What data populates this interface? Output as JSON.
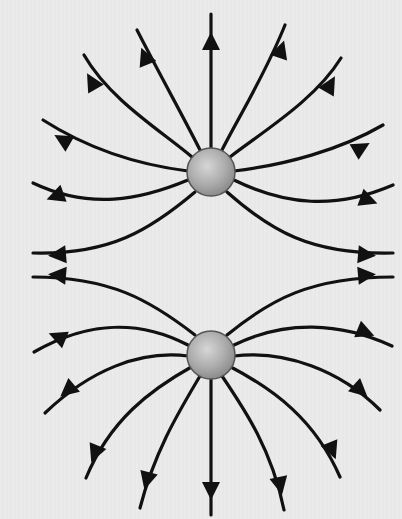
{
  "diagram": {
    "title": "Electric field lines of two like (positive) charges",
    "colors": {
      "background": "#e9e9e9",
      "field_line": "#111111",
      "charge_fill_light": "#cfcfcf",
      "charge_fill_dark": "#8a8a8a",
      "charge_stroke": "#555555"
    },
    "charges": [
      {
        "name": "top-charge",
        "cx": 211,
        "cy": 172,
        "r": 24
      },
      {
        "name": "bottom-charge",
        "cx": 211,
        "cy": 355,
        "r": 24
      }
    ],
    "field_lines": {
      "top": [
        {
          "name": "top-up",
          "d": "M211 148 L211 14",
          "arrow": {
            "x": 211,
            "y": 42,
            "angle": -90
          }
        },
        {
          "name": "top-up-left-1",
          "d": "M200 150 C185 120 160 75 137 30",
          "arrow": {
            "x": 145,
            "y": 57,
            "angle": -112
          }
        },
        {
          "name": "top-up-right-1",
          "d": "M222 150 C237 120 265 75 285 25",
          "arrow": {
            "x": 281,
            "y": 50,
            "angle": -72
          }
        },
        {
          "name": "top-up-left-2",
          "d": "M192 157 C160 130 110 100 84 55",
          "arrow": {
            "x": 92,
            "y": 82,
            "angle": -120
          }
        },
        {
          "name": "top-up-right-2",
          "d": "M230 157 C265 130 315 100 341 58",
          "arrow": {
            "x": 330,
            "y": 85,
            "angle": -60
          }
        },
        {
          "name": "top-left-1",
          "d": "M188 171 C140 165 90 150 43 120",
          "arrow": {
            "x": 63,
            "y": 140,
            "angle": -150
          }
        },
        {
          "name": "top-right-1",
          "d": "M234 171 C285 165 340 150 383 125",
          "arrow": {
            "x": 361,
            "y": 148,
            "angle": -30
          }
        },
        {
          "name": "top-left-2",
          "d": "M188 180 C140 200 90 210 33 183",
          "arrow": {
            "x": 56,
            "y": 196,
            "angle": 160
          }
        },
        {
          "name": "top-right-2",
          "d": "M234 180 C285 205 335 210 393 185",
          "arrow": {
            "x": 368,
            "y": 200,
            "angle": 20
          }
        },
        {
          "name": "top-left-3",
          "d": "M195 192 C150 230 110 255 33 253",
          "arrow": {
            "x": 58,
            "y": 255,
            "angle": 175
          }
        },
        {
          "name": "top-right-3",
          "d": "M227 192 C270 230 310 255 393 253",
          "arrow": {
            "x": 366,
            "y": 255,
            "angle": 5
          }
        }
      ],
      "bottom": [
        {
          "name": "bottom-down",
          "d": "M211 379 L211 515",
          "arrow": {
            "x": 211,
            "y": 490,
            "angle": 90
          }
        },
        {
          "name": "bottom-down-left-1",
          "d": "M200 376 C180 410 155 450 140 508",
          "arrow": {
            "x": 147,
            "y": 480,
            "angle": 105
          }
        },
        {
          "name": "bottom-down-right-1",
          "d": "M222 376 C245 410 272 450 284 510",
          "arrow": {
            "x": 280,
            "y": 485,
            "angle": 78
          }
        },
        {
          "name": "bottom-down-left-2",
          "d": "M193 366 C150 390 110 420 86 478",
          "arrow": {
            "x": 95,
            "y": 453,
            "angle": 112
          }
        },
        {
          "name": "bottom-down-right-2",
          "d": "M229 366 C275 390 315 420 340 477",
          "arrow": {
            "x": 332,
            "y": 450,
            "angle": 68
          }
        },
        {
          "name": "bottom-left-1",
          "d": "M188 356 C140 350 90 370 45 413",
          "arrow": {
            "x": 68,
            "y": 390,
            "angle": 140
          }
        },
        {
          "name": "bottom-right-1",
          "d": "M234 356 C285 350 340 370 380 410",
          "arrow": {
            "x": 360,
            "y": 390,
            "angle": 42
          }
        },
        {
          "name": "bottom-left-2",
          "d": "M188 345 C140 320 90 320 34 352",
          "arrow": {
            "x": 58,
            "y": 337,
            "angle": -158
          }
        },
        {
          "name": "bottom-right-2",
          "d": "M234 345 C285 320 340 322 392 346",
          "arrow": {
            "x": 365,
            "y": 332,
            "angle": 22
          }
        },
        {
          "name": "bottom-left-3",
          "d": "M195 335 C150 300 110 277 33 277",
          "arrow": {
            "x": 58,
            "y": 275,
            "angle": -175
          }
        },
        {
          "name": "bottom-right-3",
          "d": "M227 335 C270 300 310 277 393 277",
          "arrow": {
            "x": 366,
            "y": 275,
            "angle": -5
          }
        }
      ]
    }
  }
}
